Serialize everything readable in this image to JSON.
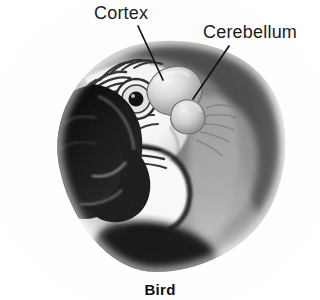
{
  "figure": {
    "caption": "Bird",
    "background_color": "#fdfdfd",
    "ink_color": "#1b1b1b"
  },
  "labels": [
    {
      "id": "cortex",
      "text": "Cortex",
      "leader_line": {
        "x1": 138,
        "y1": 26,
        "x2": 163,
        "y2": 80
      }
    },
    {
      "id": "cerebellum",
      "text": "Cerebellum",
      "leader_line": {
        "x1": 229,
        "y1": 46,
        "x2": 193,
        "y2": 99
      }
    }
  ],
  "anatomy": {
    "cortex_label": "Cortex",
    "cerebellum_label": "Cerebellum"
  }
}
